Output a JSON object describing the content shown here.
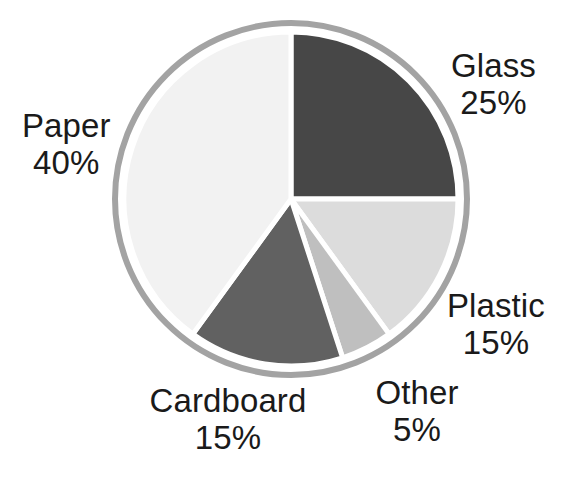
{
  "chart_data": {
    "type": "pie",
    "title": "",
    "subtitle": "",
    "xlabel": "",
    "ylabel": "",
    "legend_position": "none",
    "grid": false,
    "labels_inline": true,
    "unit": "%",
    "total": 100,
    "start_angle_deg": 0,
    "direction": "clockwise",
    "categories": [
      "Glass",
      "Plastic",
      "Other",
      "Cardboard",
      "Paper"
    ],
    "values": [
      25,
      15,
      5,
      15,
      40
    ],
    "slices": [
      {
        "name": "Glass",
        "value": 25,
        "value_text": "25%",
        "color": "#474747",
        "start_deg": 0,
        "end_deg": 90
      },
      {
        "name": "Plastic",
        "value": 15,
        "value_text": "15%",
        "color": "#dcdcdc",
        "start_deg": 90,
        "end_deg": 144
      },
      {
        "name": "Other",
        "value": 5,
        "value_text": "5%",
        "color": "#bfbfbf",
        "start_deg": 144,
        "end_deg": 162
      },
      {
        "name": "Cardboard",
        "value": 15,
        "value_text": "15%",
        "color": "#616161",
        "start_deg": 162,
        "end_deg": 216
      },
      {
        "name": "Paper",
        "value": 40,
        "value_text": "40%",
        "color": "#f2f2f2",
        "start_deg": 216,
        "end_deg": 360
      }
    ]
  },
  "labels": {
    "glass": {
      "name": "Glass",
      "value": "25%"
    },
    "paper": {
      "name": "Paper",
      "value": "40%"
    },
    "plastic": {
      "name": "Plastic",
      "value": "15%"
    },
    "cardboard": {
      "name": "Cardboard",
      "value": "15%"
    },
    "other": {
      "name": "Other",
      "value": "5%"
    }
  },
  "style": {
    "background": "#ffffff",
    "text_color": "#1a1a1a",
    "ring_color": "#a3a3a3",
    "separator_color": "#ffffff",
    "center_x": 291,
    "center_y": 199,
    "ring_radius": 176,
    "slice_radius": 167
  }
}
